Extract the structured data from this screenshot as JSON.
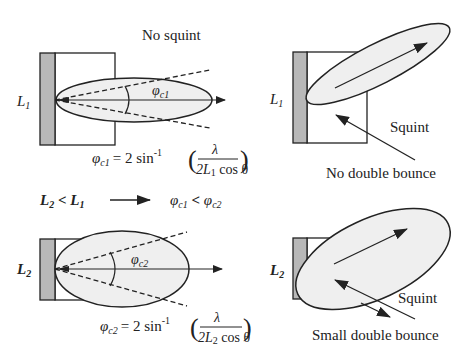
{
  "colors": {
    "stroke": "#222222",
    "wall_fill": "#b8b8b8",
    "beam_fill": "#efefef",
    "background": "#ffffff"
  },
  "top_left": {
    "title": "No squint",
    "wall_label": "L",
    "wall_label_sub": "1",
    "angle_label": "φ",
    "angle_label_sub": "c1",
    "equation": {
      "lhs": "φ",
      "lhs_sub": "c1",
      "eq": "= 2 sin",
      "exp": "-1",
      "numerator": "λ",
      "denominator_pre": "2L",
      "denominator_sub": "1",
      "denominator_post": " cos θ"
    }
  },
  "top_right": {
    "wall_label": "L",
    "wall_label_sub": "1",
    "squint_label": "Squint",
    "bounce_label": "No double bounce"
  },
  "middle": {
    "left_L2": "L",
    "left_L2_sub": "2",
    "lt": " < ",
    "left_L1": "L",
    "left_L1_sub": "1",
    "right_phi1": "φ",
    "right_phi1_sub": "c1",
    "right_lt": " < ",
    "right_phi2": "φ",
    "right_phi2_sub": "c2"
  },
  "bottom_left": {
    "wall_label": "L",
    "wall_label_sub": "2",
    "angle_label": "φ",
    "angle_label_sub": "c2",
    "equation": {
      "lhs": "φ",
      "lhs_sub": "c2",
      "eq": "= 2 sin",
      "exp": "-1",
      "numerator": "λ",
      "denominator_pre": "2L",
      "denominator_sub": "2",
      "denominator_post": " cos θ"
    }
  },
  "bottom_right": {
    "wall_label": "L",
    "wall_label_sub": "2",
    "squint_label": "Squint",
    "bounce_label": "Small double bounce"
  }
}
